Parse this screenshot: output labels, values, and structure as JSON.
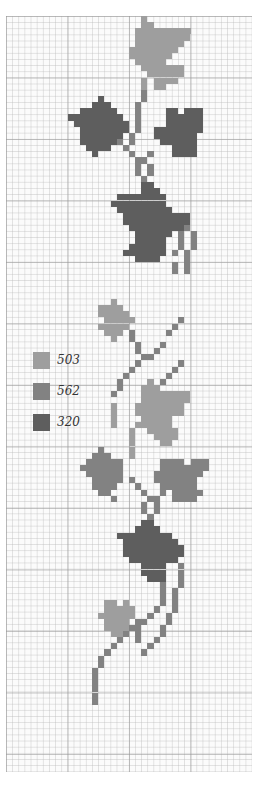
{
  "legend": [
    {
      "code": "503",
      "color": "#9e9e9e"
    },
    {
      "code": "562",
      "color": "#828282"
    },
    {
      "code": "320",
      "color": "#5e5e5e"
    }
  ],
  "chart_data": {
    "type": "heatmap",
    "title": "",
    "grid": {
      "cols": 40,
      "rows": 123,
      "cell_px": 6.15,
      "major_every": 10
    },
    "colors": {
      "a": "#9e9e9e",
      "b": "#828282",
      "c": "#5e5e5e"
    },
    "spans": [
      [
        0,
        22,
        22,
        "a"
      ],
      [
        1,
        22,
        23,
        "a"
      ],
      [
        2,
        21,
        24,
        "a"
      ],
      [
        2,
        25,
        29,
        "a"
      ],
      [
        3,
        21,
        29,
        "a"
      ],
      [
        4,
        21,
        28,
        "a"
      ],
      [
        5,
        20,
        27,
        "a"
      ],
      [
        6,
        20,
        26,
        "a"
      ],
      [
        7,
        21,
        25,
        "a"
      ],
      [
        8,
        22,
        26,
        "a"
      ],
      [
        8,
        27,
        28,
        "a"
      ],
      [
        9,
        23,
        28,
        "a"
      ],
      [
        10,
        24,
        27,
        "a"
      ],
      [
        11,
        24,
        25,
        "a"
      ],
      [
        10,
        22,
        22,
        "a"
      ],
      [
        11,
        22,
        22,
        "a"
      ],
      [
        12,
        22,
        22,
        "b"
      ],
      [
        13,
        22,
        22,
        "b"
      ],
      [
        13,
        15,
        15,
        "c"
      ],
      [
        14,
        14,
        16,
        "c"
      ],
      [
        15,
        12,
        17,
        "c"
      ],
      [
        15,
        26,
        27,
        "c"
      ],
      [
        15,
        29,
        31,
        "c"
      ],
      [
        16,
        10,
        18,
        "c"
      ],
      [
        16,
        26,
        31,
        "c"
      ],
      [
        17,
        11,
        19,
        "c"
      ],
      [
        17,
        26,
        31,
        "c"
      ],
      [
        18,
        12,
        19,
        "c"
      ],
      [
        18,
        24,
        31,
        "c"
      ],
      [
        19,
        12,
        18,
        "c"
      ],
      [
        19,
        24,
        30,
        "c"
      ],
      [
        20,
        12,
        17,
        "c"
      ],
      [
        20,
        25,
        30,
        "c"
      ],
      [
        21,
        13,
        16,
        "c"
      ],
      [
        21,
        27,
        30,
        "c"
      ],
      [
        22,
        14,
        14,
        "c"
      ],
      [
        22,
        27,
        30,
        "c"
      ],
      [
        14,
        21,
        21,
        "b"
      ],
      [
        15,
        21,
        21,
        "b"
      ],
      [
        16,
        21,
        21,
        "b"
      ],
      [
        17,
        21,
        21,
        "b"
      ],
      [
        18,
        21,
        21,
        "b"
      ],
      [
        19,
        20,
        20,
        "b"
      ],
      [
        20,
        20,
        20,
        "b"
      ],
      [
        20,
        18,
        18,
        "b"
      ],
      [
        21,
        19,
        19,
        "b"
      ],
      [
        22,
        20,
        20,
        "b"
      ],
      [
        22,
        23,
        23,
        "b"
      ],
      [
        23,
        21,
        21,
        "b"
      ],
      [
        23,
        22,
        22,
        "b"
      ],
      [
        24,
        21,
        21,
        "b"
      ],
      [
        24,
        23,
        23,
        "b"
      ],
      [
        25,
        21,
        21,
        "b"
      ],
      [
        25,
        23,
        23,
        "b"
      ],
      [
        26,
        22,
        22,
        "b"
      ],
      [
        27,
        22,
        23,
        "c"
      ],
      [
        28,
        22,
        24,
        "c"
      ],
      [
        29,
        18,
        25,
        "c"
      ],
      [
        30,
        17,
        25,
        "c"
      ],
      [
        31,
        18,
        26,
        "c"
      ],
      [
        32,
        19,
        29,
        "c"
      ],
      [
        33,
        19,
        29,
        "c"
      ],
      [
        34,
        20,
        28,
        "c"
      ],
      [
        35,
        21,
        26,
        "c"
      ],
      [
        36,
        21,
        25,
        "c"
      ],
      [
        37,
        20,
        25,
        "c"
      ],
      [
        38,
        19,
        25,
        "c"
      ],
      [
        39,
        21,
        24,
        "c"
      ],
      [
        33,
        27,
        27,
        "c"
      ],
      [
        34,
        29,
        29,
        "b"
      ],
      [
        35,
        28,
        28,
        "b"
      ],
      [
        35,
        30,
        30,
        "b"
      ],
      [
        36,
        28,
        28,
        "b"
      ],
      [
        36,
        30,
        30,
        "b"
      ],
      [
        37,
        28,
        28,
        "b"
      ],
      [
        37,
        30,
        30,
        "b"
      ],
      [
        38,
        27,
        27,
        "b"
      ],
      [
        38,
        29,
        29,
        "b"
      ],
      [
        39,
        29,
        29,
        "b"
      ],
      [
        40,
        27,
        27,
        "b"
      ],
      [
        40,
        29,
        29,
        "b"
      ],
      [
        41,
        27,
        27,
        "b"
      ],
      [
        41,
        29,
        29,
        "b"
      ],
      [
        46,
        17,
        17,
        "a"
      ],
      [
        47,
        15,
        18,
        "a"
      ],
      [
        48,
        15,
        19,
        "a"
      ],
      [
        49,
        16,
        20,
        "a"
      ],
      [
        50,
        15,
        19,
        "a"
      ],
      [
        51,
        16,
        18,
        "a"
      ],
      [
        52,
        17,
        17,
        "a"
      ],
      [
        49,
        28,
        28,
        "b"
      ],
      [
        50,
        27,
        27,
        "b"
      ],
      [
        51,
        26,
        26,
        "b"
      ],
      [
        51,
        20,
        20,
        "b"
      ],
      [
        52,
        20,
        20,
        "b"
      ],
      [
        53,
        21,
        21,
        "b"
      ],
      [
        53,
        25,
        25,
        "b"
      ],
      [
        54,
        21,
        21,
        "b"
      ],
      [
        54,
        24,
        24,
        "b"
      ],
      [
        55,
        22,
        22,
        "b"
      ],
      [
        55,
        23,
        23,
        "b"
      ],
      [
        56,
        21,
        21,
        "b"
      ],
      [
        56,
        28,
        28,
        "b"
      ],
      [
        57,
        20,
        20,
        "b"
      ],
      [
        57,
        27,
        27,
        "b"
      ],
      [
        58,
        19,
        19,
        "b"
      ],
      [
        58,
        26,
        26,
        "b"
      ],
      [
        59,
        18,
        18,
        "b"
      ],
      [
        59,
        25,
        25,
        "b"
      ],
      [
        60,
        18,
        18,
        "b"
      ],
      [
        61,
        17,
        17,
        "b"
      ],
      [
        59,
        23,
        23,
        "a"
      ],
      [
        60,
        22,
        24,
        "a"
      ],
      [
        61,
        22,
        25,
        "a"
      ],
      [
        61,
        26,
        29,
        "a"
      ],
      [
        62,
        22,
        29,
        "a"
      ],
      [
        63,
        21,
        28,
        "a"
      ],
      [
        64,
        21,
        28,
        "a"
      ],
      [
        65,
        22,
        26,
        "a"
      ],
      [
        66,
        22,
        26,
        "a"
      ],
      [
        67,
        23,
        27,
        "a"
      ],
      [
        68,
        24,
        27,
        "a"
      ],
      [
        69,
        25,
        26,
        "a"
      ],
      [
        63,
        17,
        17,
        "a"
      ],
      [
        64,
        17,
        17,
        "a"
      ],
      [
        65,
        17,
        17,
        "a"
      ],
      [
        66,
        17,
        17,
        "a"
      ],
      [
        66,
        21,
        21,
        "a"
      ],
      [
        67,
        20,
        20,
        "a"
      ],
      [
        68,
        20,
        20,
        "a"
      ],
      [
        69,
        20,
        20,
        "a"
      ],
      [
        70,
        20,
        20,
        "a"
      ],
      [
        71,
        20,
        20,
        "a"
      ],
      [
        70,
        15,
        15,
        "b"
      ],
      [
        71,
        14,
        16,
        "b"
      ],
      [
        72,
        13,
        18,
        "b"
      ],
      [
        72,
        25,
        28,
        "b"
      ],
      [
        72,
        30,
        32,
        "b"
      ],
      [
        73,
        12,
        18,
        "b"
      ],
      [
        73,
        25,
        32,
        "b"
      ],
      [
        74,
        13,
        18,
        "b"
      ],
      [
        74,
        24,
        31,
        "b"
      ],
      [
        75,
        14,
        18,
        "b"
      ],
      [
        75,
        24,
        30,
        "b"
      ],
      [
        76,
        14,
        17,
        "b"
      ],
      [
        76,
        25,
        30,
        "b"
      ],
      [
        77,
        15,
        16,
        "b"
      ],
      [
        77,
        27,
        31,
        "b"
      ],
      [
        78,
        17,
        17,
        "b"
      ],
      [
        78,
        27,
        30,
        "b"
      ],
      [
        75,
        20,
        20,
        "b"
      ],
      [
        76,
        21,
        21,
        "b"
      ],
      [
        77,
        22,
        22,
        "b"
      ],
      [
        77,
        25,
        25,
        "b"
      ],
      [
        78,
        23,
        23,
        "b"
      ],
      [
        78,
        24,
        24,
        "b"
      ],
      [
        79,
        22,
        22,
        "b"
      ],
      [
        79,
        24,
        24,
        "b"
      ],
      [
        80,
        22,
        22,
        "b"
      ],
      [
        80,
        24,
        24,
        "b"
      ],
      [
        81,
        23,
        23,
        "b"
      ],
      [
        82,
        22,
        23,
        "c"
      ],
      [
        83,
        21,
        24,
        "c"
      ],
      [
        84,
        18,
        26,
        "c"
      ],
      [
        85,
        19,
        27,
        "c"
      ],
      [
        86,
        19,
        28,
        "c"
      ],
      [
        87,
        19,
        28,
        "c"
      ],
      [
        88,
        20,
        26,
        "c"
      ],
      [
        89,
        22,
        25,
        "c"
      ],
      [
        90,
        22,
        25,
        "c"
      ],
      [
        91,
        23,
        25,
        "c"
      ],
      [
        88,
        27,
        27,
        "c"
      ],
      [
        89,
        28,
        28,
        "b"
      ],
      [
        90,
        28,
        28,
        "b"
      ],
      [
        91,
        28,
        28,
        "b"
      ],
      [
        92,
        25,
        25,
        "b"
      ],
      [
        92,
        28,
        28,
        "b"
      ],
      [
        93,
        25,
        25,
        "b"
      ],
      [
        93,
        27,
        27,
        "b"
      ],
      [
        94,
        25,
        25,
        "b"
      ],
      [
        94,
        27,
        27,
        "b"
      ],
      [
        95,
        25,
        25,
        "b"
      ],
      [
        95,
        27,
        27,
        "b"
      ],
      [
        96,
        24,
        24,
        "b"
      ],
      [
        96,
        27,
        27,
        "b"
      ],
      [
        97,
        23,
        23,
        "b"
      ],
      [
        97,
        26,
        26,
        "b"
      ],
      [
        98,
        22,
        22,
        "b"
      ],
      [
        98,
        26,
        26,
        "b"
      ],
      [
        99,
        20,
        20,
        "b"
      ],
      [
        99,
        25,
        25,
        "b"
      ],
      [
        100,
        19,
        19,
        "b"
      ],
      [
        100,
        25,
        25,
        "b"
      ],
      [
        101,
        18,
        18,
        "b"
      ],
      [
        101,
        24,
        24,
        "b"
      ],
      [
        102,
        17,
        17,
        "b"
      ],
      [
        102,
        23,
        23,
        "b"
      ],
      [
        103,
        16,
        16,
        "b"
      ],
      [
        103,
        22,
        22,
        "b"
      ],
      [
        104,
        15,
        15,
        "b"
      ],
      [
        105,
        15,
        15,
        "b"
      ],
      [
        106,
        14,
        14,
        "b"
      ],
      [
        107,
        14,
        14,
        "b"
      ],
      [
        108,
        14,
        14,
        "b"
      ],
      [
        109,
        14,
        14,
        "b"
      ],
      [
        110,
        14,
        14,
        "b"
      ],
      [
        111,
        14,
        14,
        "b"
      ],
      [
        95,
        16,
        17,
        "a"
      ],
      [
        95,
        19,
        19,
        "a"
      ],
      [
        96,
        16,
        20,
        "a"
      ],
      [
        97,
        15,
        20,
        "a"
      ],
      [
        98,
        16,
        19,
        "a"
      ],
      [
        99,
        16,
        19,
        "a"
      ],
      [
        100,
        17,
        18,
        "a"
      ],
      [
        98,
        21,
        21,
        "b"
      ],
      [
        99,
        21,
        21,
        "b"
      ],
      [
        100,
        21,
        21,
        "b"
      ],
      [
        101,
        21,
        21,
        "b"
      ]
    ]
  }
}
